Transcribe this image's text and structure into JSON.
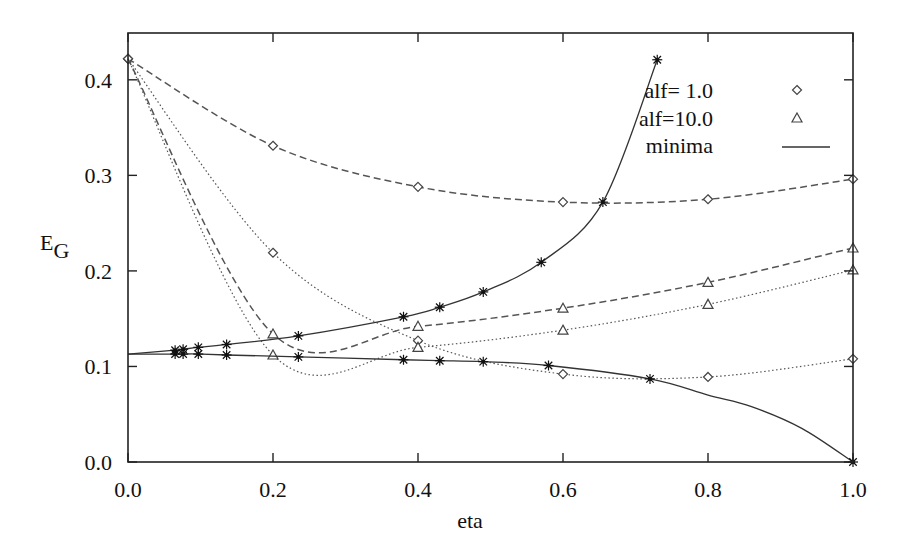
{
  "chart_data": {
    "type": "line",
    "title": "",
    "xlabel": "eta",
    "ylabel": "E",
    "ylabel_subscript": "G",
    "xlim": [
      0.0,
      1.0
    ],
    "ylim": [
      0.0,
      0.449
    ],
    "grid": false,
    "legend_position": "top-right",
    "x_ticks": [
      0.0,
      0.2,
      0.4,
      0.6,
      0.8,
      1.0
    ],
    "x_tick_labels": [
      "0.0",
      "0.2",
      "0.4",
      "0.6",
      "0.8",
      "1.0"
    ],
    "y_ticks": [
      0.0,
      0.1,
      0.2,
      0.3,
      0.4
    ],
    "y_tick_labels": [
      "0.0",
      "0.1",
      "0.2",
      "0.3",
      "0.4"
    ],
    "legend": [
      {
        "label": "alf= 1.0",
        "marker": "diamond"
      },
      {
        "label": "alf=10.0",
        "marker": "triangle"
      },
      {
        "label": "minima",
        "marker": "line"
      }
    ],
    "series": [
      {
        "name": "alf=1.0 (dashed)",
        "marker": "diamond",
        "style": "dashed",
        "x": [
          0.0,
          0.2,
          0.4,
          0.6,
          0.8,
          1.0
        ],
        "y": [
          0.422,
          0.331,
          0.288,
          0.272,
          0.275,
          0.296
        ]
      },
      {
        "name": "alf=1.0 (dotted)",
        "marker": "diamond",
        "style": "dotted",
        "x": [
          0.0,
          0.2,
          0.4,
          0.6,
          0.8,
          1.0
        ],
        "y": [
          0.422,
          0.219,
          0.127,
          0.092,
          0.089,
          0.108
        ]
      },
      {
        "name": "alf=10.0 (dashed)",
        "marker": "triangle",
        "style": "dashed",
        "x": [
          0.0,
          0.2,
          0.4,
          0.6,
          0.8,
          1.0
        ],
        "y": [
          0.422,
          0.134,
          0.142,
          0.161,
          0.188,
          0.224
        ]
      },
      {
        "name": "alf=10.0 (dotted)",
        "marker": "triangle",
        "style": "dotted",
        "x": [
          0.0,
          0.2,
          0.4,
          0.6,
          0.8,
          1.0
        ],
        "y": [
          0.422,
          0.112,
          0.12,
          0.138,
          0.165,
          0.201
        ]
      },
      {
        "name": "minima (upper)",
        "marker": "star",
        "style": "solid",
        "x": [
          0.0,
          0.065,
          0.076,
          0.097,
          0.136,
          0.235,
          0.38,
          0.43,
          0.49,
          0.57,
          0.655,
          0.73
        ],
        "y": [
          0.113,
          0.117,
          0.118,
          0.12,
          0.123,
          0.132,
          0.152,
          0.162,
          0.178,
          0.209,
          0.272,
          0.421
        ]
      },
      {
        "name": "minima (lower)",
        "marker": "star",
        "style": "solid",
        "x": [
          0.0,
          0.065,
          0.076,
          0.097,
          0.136,
          0.235,
          0.38,
          0.43,
          0.49,
          0.58,
          0.72,
          0.8,
          0.86,
          0.93,
          1.0
        ],
        "y": [
          0.113,
          0.113,
          0.113,
          0.113,
          0.112,
          0.11,
          0.107,
          0.106,
          0.105,
          0.101,
          0.087,
          0.07,
          0.058,
          0.035,
          0.0
        ]
      }
    ]
  }
}
